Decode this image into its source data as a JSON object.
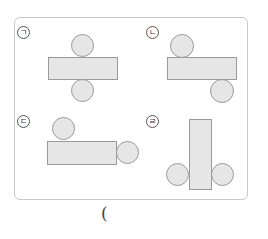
{
  "question": {
    "answer_blank_open": "(",
    "options": [
      {
        "id": "a",
        "label": "ㄱ"
      },
      {
        "id": "b",
        "label": "ㄴ"
      },
      {
        "id": "c",
        "label": "ㄷ"
      },
      {
        "id": "d",
        "label": "ㄹ"
      }
    ]
  },
  "colors": {
    "shape_fill": "#e6e6e6",
    "shape_stroke": "#9a9a9a",
    "frame_border": "#c8c8c8"
  }
}
